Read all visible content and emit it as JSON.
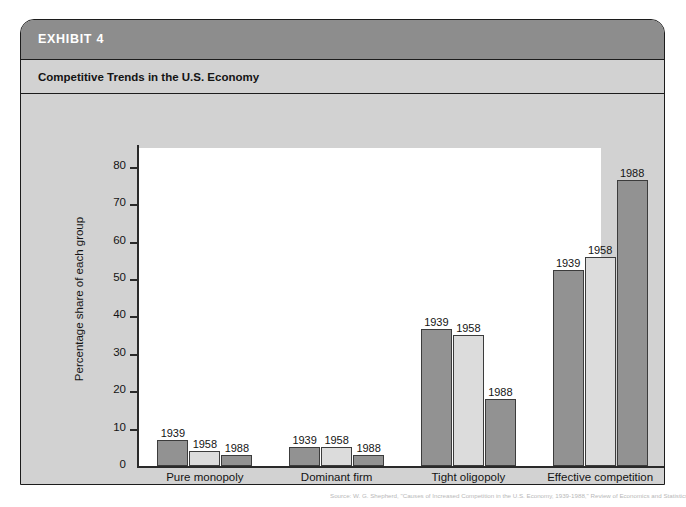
{
  "exhibit": {
    "header_label": "EXHIBIT 4",
    "subtitle": "Competitive Trends in the U.S. Economy",
    "source": "Source: W. G. Shepherd, \"Causes of Increased Competition in the U.S. Economy, 1939-1988,\" Review of Economics and Statistics."
  },
  "colors": {
    "header_band": "#8d8d8d",
    "panel_background": "#d2d2d2",
    "plot_background": "#ffffff",
    "bar_dark": "#929292",
    "bar_light": "#dcdcdc",
    "axis": "#2a2a2a",
    "text": "#141414"
  },
  "chart_data": {
    "type": "bar",
    "title": "Competitive Trends in the U.S. Economy",
    "xlabel": "",
    "ylabel": "Percentage share of each group",
    "ylim": [
      0,
      85
    ],
    "yticks": [
      0,
      10,
      20,
      30,
      40,
      50,
      60,
      70,
      80
    ],
    "ytick_labels": [
      "0",
      "10",
      "20",
      "30",
      "40",
      "50",
      "60",
      "70",
      "80"
    ],
    "grid": false,
    "legend": "none",
    "bar_labels_show_year": true,
    "categories": [
      "Pure monopoly",
      "Dominant firm",
      "Tight oligopoly",
      "Effective competition"
    ],
    "series": [
      {
        "name": "1939",
        "shade": "dark",
        "values": [
          7,
          5,
          36.5,
          52.5
        ]
      },
      {
        "name": "1958",
        "shade": "light",
        "values": [
          4,
          5,
          35,
          56
        ]
      },
      {
        "name": "1988",
        "shade": "dark",
        "values": [
          3,
          3,
          18,
          76.5
        ]
      }
    ]
  }
}
